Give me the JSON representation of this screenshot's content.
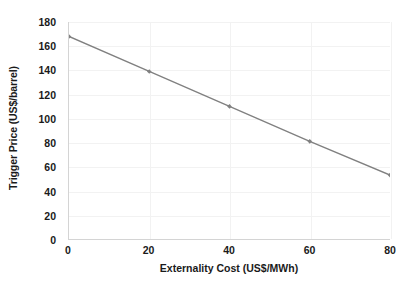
{
  "chart_data": {
    "type": "line",
    "title": "",
    "xlabel": "Externality Cost (US$/MWh)",
    "ylabel": "Trigger Price (US$/barrel)",
    "x": [
      0,
      20,
      40,
      60,
      80
    ],
    "values": [
      168,
      139,
      110,
      81,
      53
    ],
    "series": [
      {
        "name": "Trigger Price",
        "x": [
          0,
          20,
          40,
          60,
          80
        ],
        "values": [
          168,
          139,
          110,
          81,
          53
        ]
      }
    ],
    "xlim": [
      0,
      80
    ],
    "ylim": [
      0,
      180
    ],
    "x_ticks": [
      0,
      20,
      40,
      60,
      80
    ],
    "x_tick_labels": [
      "0",
      "20",
      "40",
      "60",
      "80"
    ],
    "y_ticks": [
      0,
      20,
      40,
      60,
      80,
      100,
      120,
      140,
      160,
      180
    ],
    "y_tick_labels": [
      "0",
      "20",
      "40",
      "60",
      "80",
      "100",
      "120",
      "140",
      "160",
      "180"
    ],
    "grid": true,
    "grid_color": "#f2f2f2",
    "axis_color": "#d4d4d4",
    "line_color": "#808080",
    "marker_color": "#808080",
    "marker_shape": "diamond",
    "legend": false,
    "legend_position": "none",
    "background": "#ffffff",
    "text_color": "#1a1a1a",
    "annotations": []
  }
}
